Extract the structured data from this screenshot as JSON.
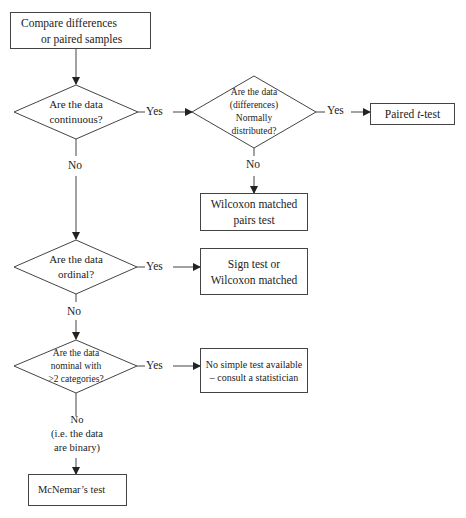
{
  "nodes": {
    "start": {
      "line1": "Compare differences",
      "line2": "or paired samples"
    },
    "q_continuous": {
      "line1": "Are the data",
      "line2": "continuous?"
    },
    "q_normal": {
      "line1": "Are the data",
      "line2": "(differences)",
      "line3": "Normally",
      "line4": "distributed?"
    },
    "paired_t": {
      "prefix": "Paired ",
      "italic": "t",
      "suffix": "-test"
    },
    "wilcoxon": {
      "line1": "Wilcoxon matched",
      "line2": "pairs test"
    },
    "q_ordinal": {
      "line1": "Are the data",
      "line2": "ordinal?"
    },
    "sign_test": {
      "line1": "Sign test or",
      "line2": "Wilcoxon matched"
    },
    "q_nominal": {
      "line1": "Are the data",
      "line2": "nominal with",
      "line3": ">2 categories?"
    },
    "no_simple": {
      "line1": "No simple test available",
      "line2": "– consult a statistician"
    },
    "mcnemar": {
      "label": "McNemar’s test"
    }
  },
  "edges": {
    "yes": "Yes",
    "no": "No",
    "no_binary_line1": "No",
    "no_binary_line2": "(i.e. the data",
    "no_binary_line3": "are binary)"
  },
  "colors": {
    "line": "#333333",
    "border": "#444444"
  }
}
